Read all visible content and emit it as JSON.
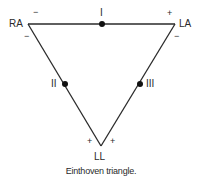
{
  "diagram": {
    "title": "Einthoven triangle",
    "vertices": {
      "ra": {
        "label": "RA"
      },
      "la": {
        "label": "LA"
      },
      "ll": {
        "label": "LL"
      }
    },
    "leads": {
      "lead_i": {
        "label": "I",
        "from": "RA",
        "to": "LA"
      },
      "lead_ii": {
        "label": "II",
        "from": "RA",
        "to": "LL"
      },
      "lead_iii": {
        "label": "III",
        "from": "LA",
        "to": "LL"
      }
    },
    "polarity": {
      "lead_i_ra": "−",
      "lead_i_la": "+",
      "lead_ii_ra": "−",
      "lead_iii_la": "−",
      "lead_ii_ll": "+",
      "lead_iii_ll": "+"
    },
    "caption": "Einthoven triangle.",
    "colors": {
      "line": "#2a2a2a",
      "dot": "#111111"
    }
  }
}
